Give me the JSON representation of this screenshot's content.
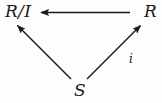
{
  "figure": {
    "kind": "commutative-triangle-diagram",
    "background_color": "#fdfdfd",
    "ink_color": "#191919"
  },
  "nodes": [
    {
      "id": "quotient",
      "label": "R/I",
      "position": "top-left"
    },
    {
      "id": "ring",
      "label": "R",
      "position": "top-right"
    },
    {
      "id": "subring",
      "label": "S",
      "position": "bottom-center"
    }
  ],
  "edges": [
    {
      "id": "projection",
      "from": "R",
      "to": "R/I",
      "label": "",
      "direction": "leftward-horizontal"
    },
    {
      "id": "composite",
      "from": "S",
      "to": "R/I",
      "label": "",
      "direction": "up-left-diagonal"
    },
    {
      "id": "inclusion",
      "from": "S",
      "to": "R",
      "label": "i",
      "direction": "up-right-diagonal"
    }
  ],
  "geometry": {
    "width": 162,
    "height": 103,
    "horizontal_arrow": {
      "x1": 130,
      "y1": 12,
      "x2": 40,
      "y2": 12
    },
    "left_diagonal_arrow": {
      "x1": 72,
      "y1": 80,
      "x2": 17,
      "y2": 25
    },
    "right_diagonal_arrow": {
      "x1": 86,
      "y1": 80,
      "x2": 141,
      "y2": 25
    }
  }
}
